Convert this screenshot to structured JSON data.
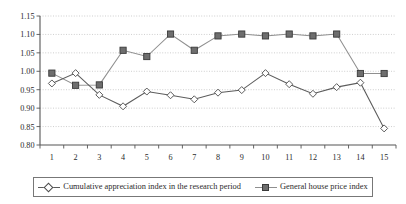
{
  "chart_data": {
    "type": "line",
    "title": "",
    "subtitle": "",
    "xlabel": "",
    "ylabel": "",
    "categories": [
      "1",
      "2",
      "3",
      "4",
      "5",
      "6",
      "7",
      "8",
      "9",
      "10",
      "11",
      "12",
      "13",
      "14",
      "15"
    ],
    "x": [
      1,
      2,
      3,
      4,
      5,
      6,
      7,
      8,
      9,
      10,
      11,
      12,
      13,
      14,
      15
    ],
    "xlim": [
      0.5,
      15.5
    ],
    "ylim": [
      0.8,
      1.15
    ],
    "y_ticks": [
      "0.80",
      "0.85",
      "0.90",
      "0.95",
      "1.00",
      "1.05",
      "1.10",
      "1.15"
    ],
    "y_tick_values": [
      0.8,
      0.85,
      0.9,
      0.95,
      1.0,
      1.05,
      1.1,
      1.15
    ],
    "grid": true,
    "grid_axis": "y",
    "legend_position": "bottom",
    "series": [
      {
        "name": "Cumulative appreciation index in the research period",
        "marker": "diamond",
        "color": "#5c5c5c",
        "values": [
          0.967,
          0.995,
          0.936,
          0.905,
          0.945,
          0.935,
          0.924,
          0.942,
          0.949,
          0.995,
          0.965,
          0.939,
          0.957,
          0.969,
          0.845
        ]
      },
      {
        "name": "General house price index",
        "marker": "square",
        "color": "#8f8f8f",
        "values": [
          0.995,
          0.962,
          0.963,
          1.057,
          1.04,
          1.101,
          1.057,
          1.096,
          1.101,
          1.096,
          1.101,
          1.096,
          1.101,
          0.994,
          0.994
        ]
      }
    ]
  },
  "legend": {
    "entries": [
      {
        "label": "Cumulative appreciation index in the research period",
        "marker": "diamond-marker"
      },
      {
        "label": "General house price index",
        "marker": "square-marker"
      }
    ]
  }
}
